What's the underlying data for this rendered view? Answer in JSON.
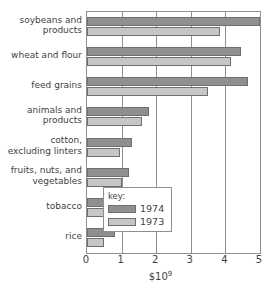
{
  "chart_data": {
    "type": "bar",
    "orientation": "horizontal",
    "title": "",
    "xlabel": "$10⁹",
    "ylabel": "",
    "xlim": [
      0,
      5
    ],
    "xticks": [
      "0",
      "1",
      "2",
      "3",
      "4",
      "5"
    ],
    "grid": true,
    "legend_position": "inside-bottom-right",
    "categories": [
      "soybeans and products",
      "wheat and flour",
      "feed grains",
      "animals and products",
      "cotton, excluding linters",
      "fruits, nuts, and vegetables",
      "tobacco",
      "rice"
    ],
    "category_label_lines": [
      [
        "soybeans and",
        "products"
      ],
      [
        "wheat and flour"
      ],
      [
        "feed grains"
      ],
      [
        "animals and",
        "products"
      ],
      [
        "cotton,",
        "excluding linters"
      ],
      [
        "fruits, nuts, and",
        "vegetables"
      ],
      [
        "tobacco"
      ],
      [
        "rice"
      ]
    ],
    "series": [
      {
        "name": "1974",
        "color": "#8f8f8f",
        "values": [
          5.0,
          4.45,
          4.65,
          1.78,
          1.3,
          1.2,
          0.83,
          0.82
        ]
      },
      {
        "name": "1973",
        "color": "#c6c6c6",
        "values": [
          3.85,
          4.15,
          3.5,
          1.58,
          0.95,
          1.02,
          0.68,
          0.5
        ]
      }
    ]
  },
  "legend": {
    "title": "key:",
    "entries": [
      {
        "label": "1974",
        "swatch_class": "y1974"
      },
      {
        "label": "1973",
        "swatch_class": "y1973"
      }
    ]
  },
  "axis": {
    "x_title_prefix": "$10",
    "x_title_exponent": "9"
  }
}
